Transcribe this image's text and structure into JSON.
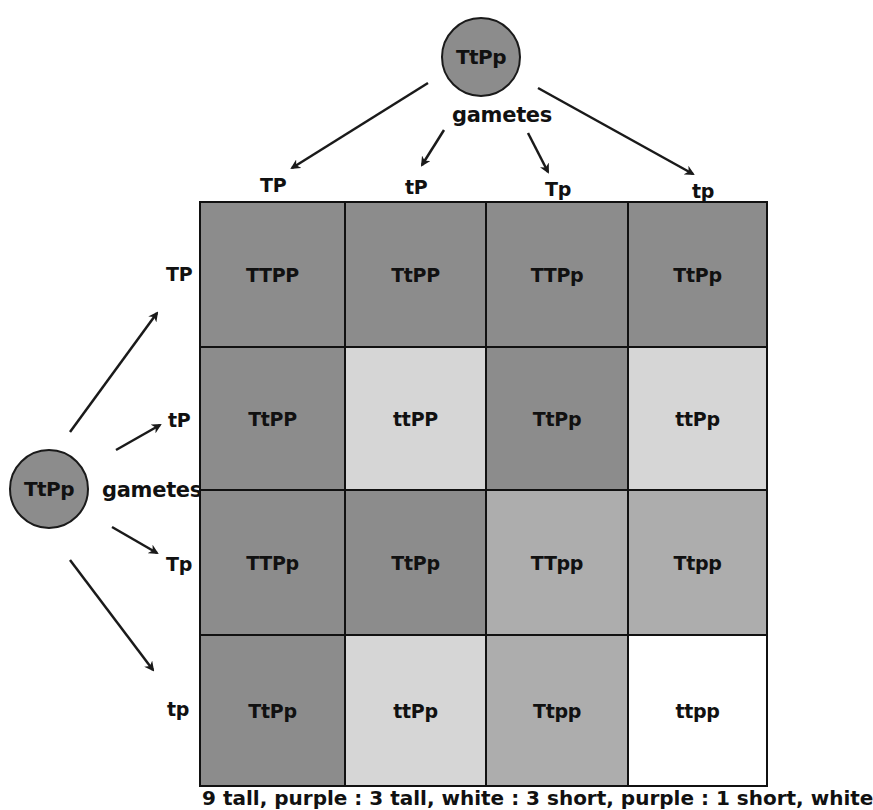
{
  "top_parent": {
    "genotype": "TtPp",
    "gametes_label": "gametes",
    "color": "#8c8c8c"
  },
  "left_parent": {
    "genotype": "TtPp",
    "gametes_label": "gametes",
    "color": "#8c8c8c"
  },
  "column_gametes": [
    "TP",
    "tP",
    "Tp",
    "tp"
  ],
  "row_gametes": [
    "TP",
    "tP",
    "Tp",
    "tp"
  ],
  "colors": {
    "tall_purple": "#8c8c8c",
    "short_purple": "#d6d6d6",
    "tall_white": "#adadad",
    "short_white": "#ffffff",
    "border": "#111111"
  },
  "grid": [
    [
      {
        "genotype": "TTPP",
        "phenotype": "tall_purple"
      },
      {
        "genotype": "TtPP",
        "phenotype": "tall_purple"
      },
      {
        "genotype": "TTPp",
        "phenotype": "tall_purple"
      },
      {
        "genotype": "TtPp",
        "phenotype": "tall_purple"
      }
    ],
    [
      {
        "genotype": "TtPP",
        "phenotype": "tall_purple"
      },
      {
        "genotype": "ttPP",
        "phenotype": "short_purple"
      },
      {
        "genotype": "TtPp",
        "phenotype": "tall_purple"
      },
      {
        "genotype": "ttPp",
        "phenotype": "short_purple"
      }
    ],
    [
      {
        "genotype": "TTPp",
        "phenotype": "tall_purple"
      },
      {
        "genotype": "TtPp",
        "phenotype": "tall_purple"
      },
      {
        "genotype": "TTpp",
        "phenotype": "tall_white"
      },
      {
        "genotype": "Ttpp",
        "phenotype": "tall_white"
      }
    ],
    [
      {
        "genotype": "TtPp",
        "phenotype": "tall_purple"
      },
      {
        "genotype": "ttPp",
        "phenotype": "short_purple"
      },
      {
        "genotype": "Ttpp",
        "phenotype": "tall_white"
      },
      {
        "genotype": "ttpp",
        "phenotype": "short_white"
      }
    ]
  ],
  "caption": "9 tall, purple : 3 tall, white : 3 short, purple : 1 short, white"
}
